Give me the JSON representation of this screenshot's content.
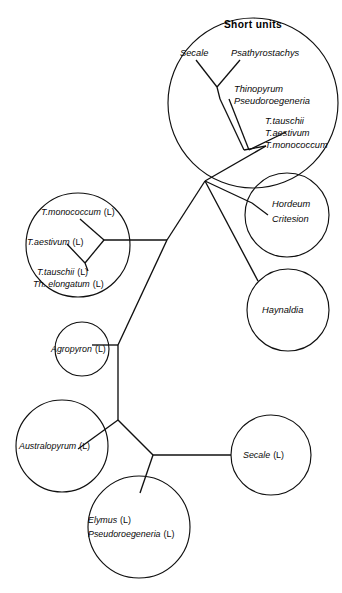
{
  "figure": {
    "type": "phylogenetic-tree",
    "title": "",
    "width": 342,
    "height": 593,
    "background_color": "#ffffff",
    "line_color": "#101010"
  },
  "groups": {
    "short_units": {
      "title": "Short units",
      "members": [
        "Secale",
        "Psathyrostachys",
        "Thinopyrum",
        "Pseudoroegeneria",
        "T.tauschii",
        "T.aestivum",
        "T.monococcum"
      ]
    },
    "hordeum_group": {
      "members": [
        "Hordeum",
        "Critesion"
      ]
    },
    "haynaldia_group": {
      "members": [
        "Haynaldia"
      ]
    },
    "long_units_left": {
      "members": [
        "T.monococcum  (L)",
        "T.aestivum  (L)",
        "T.tauschii  (L)",
        "Th. elongatum (L)"
      ]
    },
    "agropyron_group": {
      "members": [
        "Agropyron  (L)"
      ]
    },
    "australopyrum_group": {
      "members": [
        "Australopyrum  (L)"
      ]
    },
    "secale_long_group": {
      "members": [
        "Secale  (L)"
      ]
    },
    "elymus_group": {
      "members": [
        "Elymus  (L)",
        "Pseudoroegeneria  (L)"
      ]
    }
  },
  "labels": {
    "short_units_title": "Short units",
    "secale_short": "Secale",
    "psathyrostachys": "Psathyrostachys",
    "thinopyrum": "Thinopyrum",
    "pseudoroegeneria_short": "Pseudoroegeneria",
    "t_tauschii_short": "T.tauschii",
    "t_aestivum_short": "T.aestivum",
    "t_monococcum_short": "T.monococcum",
    "hordeum": "Hordeum",
    "critesion": "Critesion",
    "haynaldia": "Haynaldia",
    "t_monococcum_long": "T.monococcum",
    "t_monococcum_long_suffix": "(L)",
    "t_aestivum_long": "T.aestivum",
    "t_aestivum_long_suffix": "(L)",
    "t_tauschii_long": "T.tauschii",
    "t_tauschii_long_suffix": "(L)",
    "th_elongatum_long": "Th. elongatum",
    "th_elongatum_long_suffix": "(L)",
    "agropyron": "Agropyron",
    "agropyron_suffix": "(L)",
    "australopyrum": "Australopyrum",
    "australopyrum_suffix": "(L)",
    "secale_long": "Secale",
    "secale_long_suffix": "(L)",
    "elymus": "Elymus",
    "elymus_suffix": "(L)",
    "pseudoroegeneria_long": "Pseudoroegeneria",
    "pseudoroegeneria_long_suffix": "(L)"
  }
}
